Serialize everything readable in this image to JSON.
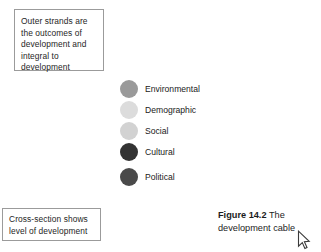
{
  "figure": {
    "background_color": "#ffffff",
    "callouts": [
      {
        "name": "outer-strands",
        "text": "Outer strands are the outcomes of development and integral to development"
      },
      {
        "name": "cross-section",
        "text": "Cross-section shows level of development"
      }
    ],
    "legend": {
      "items": [
        {
          "label": "Environmental",
          "color": "#9a9a9a"
        },
        {
          "label": "Demographic",
          "color": "#dcdcdc"
        },
        {
          "label": "Social",
          "color": "#d2d2d2"
        },
        {
          "label": "Cultural",
          "color": "#333333"
        },
        {
          "label": "Political",
          "color": "#4a4a4a"
        }
      ]
    },
    "caption": {
      "label": "Figure 14.2",
      "text": "The development cable"
    },
    "cursor": {
      "icon": "mouse-pointer-icon",
      "x": 303,
      "y": 238
    },
    "border_color": "#9b9b9b",
    "text_color": "#262626"
  }
}
